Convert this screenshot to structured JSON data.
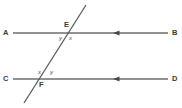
{
  "figure": {
    "kind": "geometry-diagram",
    "background_color": "#ffffff",
    "line_color": "#6e6e6e",
    "transversal_color": "#5a5a5a",
    "label_color": "#3a3a3a",
    "point_labels": {
      "a": "A",
      "b": "B",
      "c": "C",
      "d": "D",
      "e": "E",
      "f": "F"
    },
    "angle_labels": {
      "e_left": "y",
      "e_right": "x",
      "f_left": "x",
      "f_right": "y"
    },
    "lines": [
      {
        "name": "line-AB",
        "from": "A",
        "to": "B",
        "arrow": "right",
        "y": 33
      },
      {
        "name": "line-CD",
        "from": "C",
        "to": "D",
        "arrow": "right",
        "y": 79
      },
      {
        "name": "transversal-EF",
        "through": "E,F",
        "arrow": "none"
      }
    ]
  }
}
